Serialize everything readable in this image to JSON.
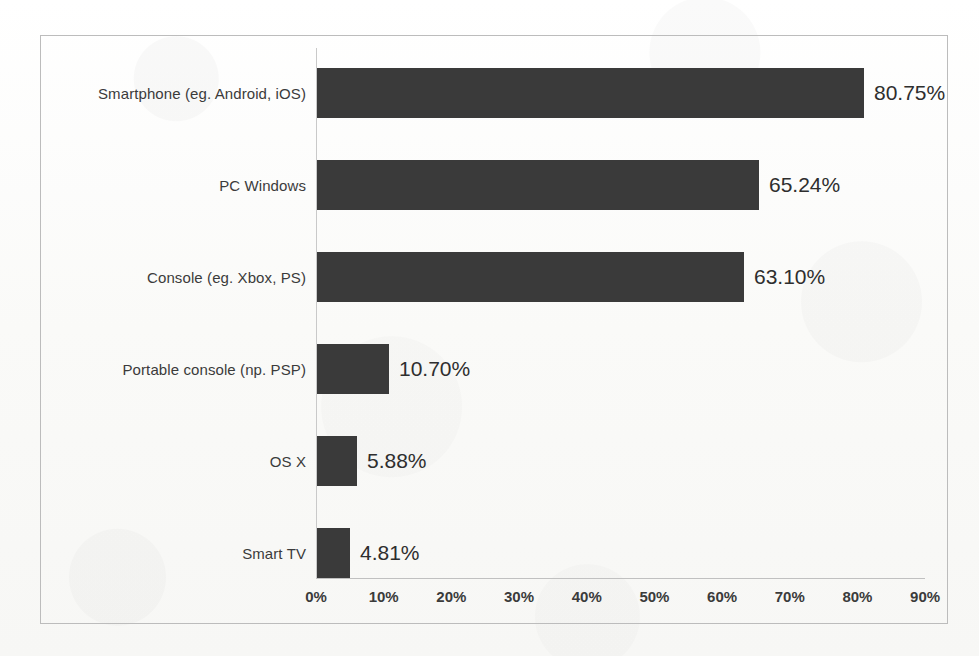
{
  "chart_data": {
    "type": "bar",
    "orientation": "horizontal",
    "title": "",
    "subtitle": "",
    "xlabel": "",
    "ylabel": "",
    "grid": false,
    "legend": false,
    "xlim": [
      0,
      90
    ],
    "xtick_labels": [
      "0%",
      "10%",
      "20%",
      "30%",
      "40%",
      "50%",
      "60%",
      "70%",
      "80%",
      "90%"
    ],
    "xticks": [
      0,
      10,
      20,
      30,
      40,
      50,
      60,
      70,
      80,
      90
    ],
    "categories": [
      "Smartphone (eg. Android, iOS)",
      "PC Windows",
      "Console (eg. Xbox, PS)",
      "Portable console (np. PSP)",
      "OS X",
      "Smart TV"
    ],
    "values": [
      80.75,
      65.24,
      63.1,
      10.7,
      5.88,
      4.81
    ],
    "value_labels": [
      "80.75%",
      "65.24%",
      "63.10%",
      "10.70%",
      "5.88%",
      "4.81%"
    ],
    "bar_color": "#3a3a3a",
    "axis_color": "#c0c0c0",
    "background_color": "#fbfbfa",
    "border_color": "#bcbcbc"
  }
}
